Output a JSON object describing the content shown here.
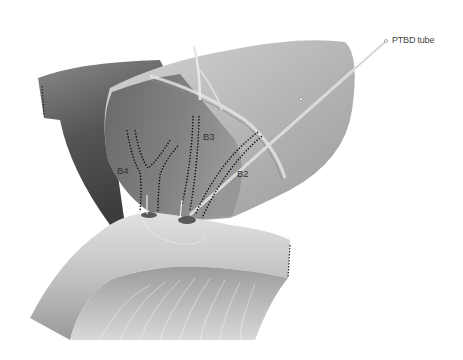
{
  "figure": {
    "labels": {
      "ptbd": "PTBD tube",
      "b2": "B2",
      "b3": "B3",
      "b4": "B4"
    },
    "colors": {
      "background": "#ffffff",
      "liver_light": "#cfcfcf",
      "liver_mid": "#a9a9a9",
      "liver_dark": "#6f6f6f",
      "duct_dots": "#111111",
      "bowel_light": "#d6d6d6",
      "bowel_dark": "#8a8a8a"
    }
  }
}
